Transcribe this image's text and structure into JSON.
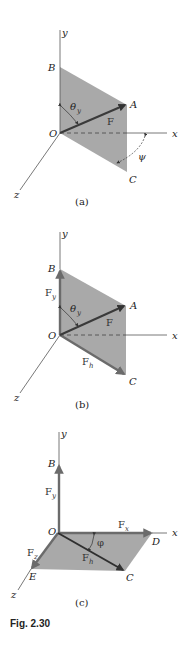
{
  "figure": {
    "caption": "Fig. 2.30",
    "panels": [
      {
        "id": "a",
        "label": "(a)",
        "axes": {
          "x": "x",
          "y": "y",
          "z": "z"
        },
        "points": {
          "origin": "O",
          "B": "B",
          "A": "A",
          "C": "C"
        },
        "vectors": [
          {
            "name": "F",
            "sub": ""
          }
        ],
        "angles": [
          {
            "symbol": "θ",
            "sub": "y"
          },
          {
            "symbol": "ψ",
            "sub": ""
          }
        ]
      },
      {
        "id": "b",
        "label": "(b)",
        "axes": {
          "x": "x",
          "y": "y",
          "z": "z"
        },
        "points": {
          "origin": "O",
          "B": "B",
          "A": "A",
          "C": "C"
        },
        "vectors": [
          {
            "name": "F",
            "sub": ""
          },
          {
            "name": "F",
            "sub": "y"
          },
          {
            "name": "F",
            "sub": "h"
          }
        ],
        "angles": [
          {
            "symbol": "θ",
            "sub": "y"
          }
        ]
      },
      {
        "id": "c",
        "label": "(c)",
        "axes": {
          "x": "x",
          "y": "y",
          "z": "z"
        },
        "points": {
          "origin": "O",
          "B": "B",
          "C": "C",
          "D": "D",
          "E": "E"
        },
        "vectors": [
          {
            "name": "F",
            "sub": "y"
          },
          {
            "name": "F",
            "sub": "x"
          },
          {
            "name": "F",
            "sub": "z"
          },
          {
            "name": "F",
            "sub": "h"
          }
        ],
        "angles": [
          {
            "symbol": "φ",
            "sub": ""
          }
        ]
      }
    ],
    "colors": {
      "plane": "#a9a9a9",
      "vector": "#3a3a3a",
      "component": "#6b6b6b",
      "axis": "#555555"
    }
  }
}
